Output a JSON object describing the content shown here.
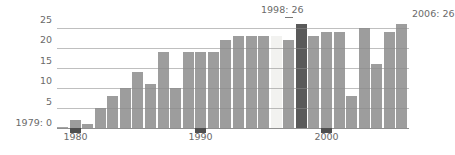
{
  "chart_data": {
    "type": "bar",
    "title": "",
    "subtitle": "",
    "xlabel": "",
    "ylabel": "",
    "grid": true,
    "legend_position": "none",
    "ylim": [
      0,
      27
    ],
    "yticks": [
      0,
      5,
      10,
      15,
      20,
      25
    ],
    "ytick_labels": [
      "1979: 0",
      "5",
      "10",
      "15",
      "20",
      "25"
    ],
    "xlim": [
      1979,
      2006
    ],
    "xticks": [
      1980,
      1990,
      2000
    ],
    "xtick_labels": [
      "1980",
      "1990",
      "2000"
    ],
    "categories": [
      "1979",
      "1980",
      "1981",
      "1982",
      "1983",
      "1984",
      "1985",
      "1986",
      "1987",
      "1988",
      "1989",
      "1990",
      "1991",
      "1992",
      "1993",
      "1994",
      "1995",
      "1996",
      "1997",
      "1998",
      "1999",
      "2000",
      "2001",
      "2002",
      "2003",
      "2004",
      "2005",
      "2006"
    ],
    "values": [
      0,
      2,
      1,
      5,
      8,
      10,
      14,
      11,
      19,
      10,
      19,
      19,
      19,
      22,
      23,
      23,
      23,
      23,
      22,
      26,
      23,
      24,
      24,
      8,
      25,
      16,
      24,
      26
    ],
    "highlights": {
      "1996": "light",
      "1998": "dark"
    },
    "annotations": [
      {
        "text": "1998: 26",
        "series_index": 19,
        "value": 26,
        "position": "top"
      },
      {
        "text": "2006: 26",
        "series_index": 27,
        "value": 26,
        "position": "right"
      },
      {
        "text": "1979: 0",
        "series_index": 0,
        "value": 0,
        "position": "left"
      }
    ]
  },
  "colors": {
    "bar": "#9d9d9d",
    "bar_highlight_light": "#f2f2f0",
    "bar_highlight_dark": "#5a5a5a",
    "grid": "#8a8a8a",
    "text": "#6a6a6a",
    "tick_marker": "#4f4f4f",
    "background": "#ffffff"
  }
}
